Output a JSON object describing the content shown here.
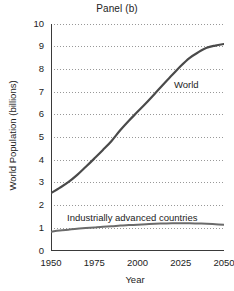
{
  "chart_data": {
    "type": "line",
    "title": "Panel (b)",
    "xlabel": "Year",
    "ylabel": "World Population (billions)",
    "xlim": [
      1950,
      2050
    ],
    "ylim": [
      0,
      10
    ],
    "grid": "horizontal-dotted",
    "legend_position": "inline-annotation",
    "xticks": [
      1950,
      1975,
      2000,
      2025,
      2050
    ],
    "xtick_labels": [
      "1950",
      "1975",
      "2000",
      "2025",
      "2050"
    ],
    "yticks": [
      0,
      1,
      2,
      3,
      4,
      5,
      6,
      7,
      8,
      9,
      10
    ],
    "ytick_labels": [
      "0",
      "1",
      "2",
      "3",
      "4",
      "5",
      "6",
      "7",
      "8",
      "9",
      "10"
    ],
    "x": [
      1950,
      1955,
      1960,
      1965,
      1970,
      1975,
      1980,
      1985,
      1990,
      1995,
      2000,
      2005,
      2010,
      2015,
      2020,
      2025,
      2030,
      2035,
      2040,
      2045,
      2050
    ],
    "series": [
      {
        "name": "World",
        "label": "World",
        "color": "#4a4a4a",
        "values": [
          2.55,
          2.78,
          3.03,
          3.34,
          3.7,
          4.07,
          4.45,
          4.85,
          5.32,
          5.74,
          6.13,
          6.52,
          6.93,
          7.35,
          7.75,
          8.15,
          8.5,
          8.75,
          8.95,
          9.05,
          9.12
        ]
      },
      {
        "name": "Industrially advanced countries",
        "label": "Industrially advanced countries",
        "color": "#6b6b6b",
        "values": [
          0.85,
          0.9,
          0.94,
          0.98,
          1.01,
          1.04,
          1.07,
          1.09,
          1.12,
          1.14,
          1.16,
          1.18,
          1.2,
          1.21,
          1.22,
          1.22,
          1.22,
          1.21,
          1.2,
          1.18,
          1.16
        ]
      }
    ],
    "annotations": [
      {
        "text": "World",
        "x": 2022,
        "y": 7.55
      },
      {
        "text": "Industrially advanced countries",
        "x": 1962,
        "y": 1.78
      }
    ]
  },
  "figure": {
    "title": "Panel (b)",
    "axis_color": "#3a3a3a",
    "grid_color": "#8d8d8d",
    "background": "#ffffff"
  }
}
